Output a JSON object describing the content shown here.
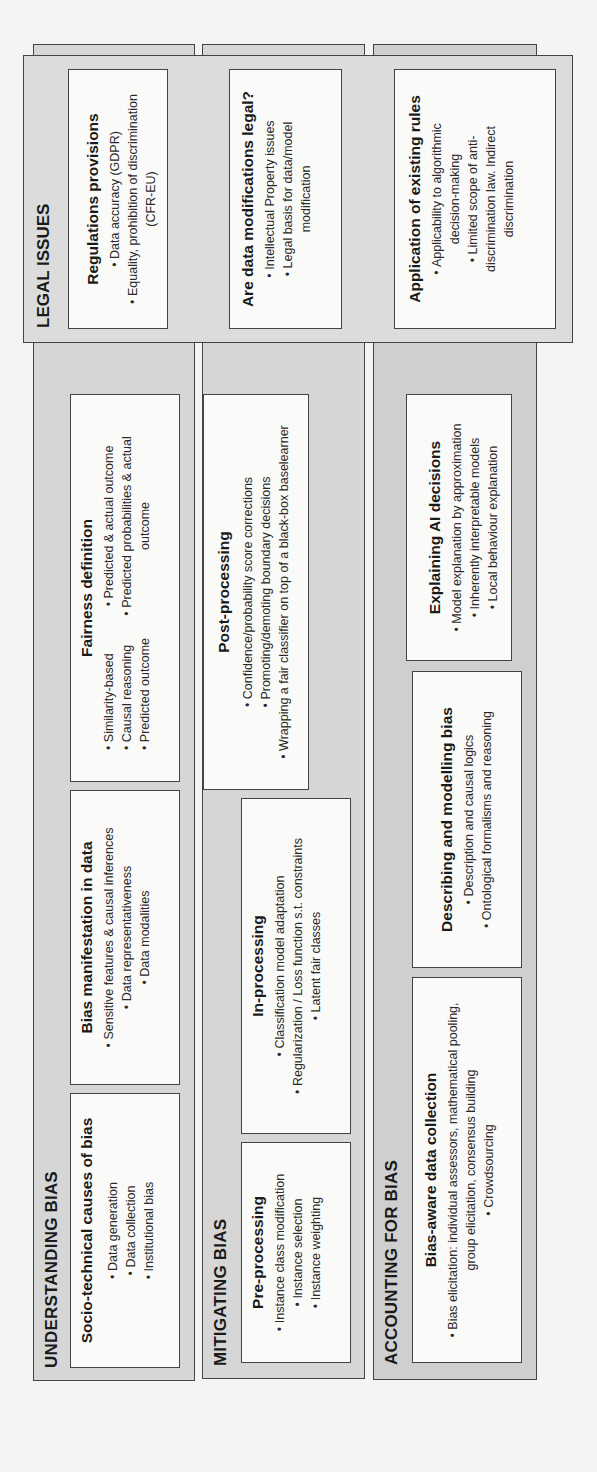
{
  "legal": {
    "title": "LEGAL ISSUES",
    "boxes": [
      {
        "title": "Regulations provisions",
        "items": [
          "Data accuracy (GDPR)",
          "Equality, prohibition of discrimination (CFR-EU)"
        ]
      },
      {
        "title": "Are data modifications legal?",
        "items": [
          "Intellectual Property issues",
          "Legal basis for data/model modification"
        ]
      },
      {
        "title": "Application of existing rules",
        "items": [
          "Applicability to algorithmic decision-making",
          "Limited scope of anti-discrimination law. Indirect discrimination"
        ]
      }
    ]
  },
  "understanding": {
    "title": "UNDERSTANDING BIAS",
    "boxes": [
      {
        "title": "Socio-technical causes of bias",
        "items": [
          "Data generation",
          "Data collection",
          "Institutional bias"
        ]
      },
      {
        "title": "Bias manifestation in data",
        "items": [
          "Sensitive features & causal inferences",
          "Data representativeness",
          "Data modalities"
        ]
      },
      {
        "title": "Fairness definition",
        "items_left": [
          "Similarity-based",
          "Causal reasoning",
          "Predicted outcome"
        ],
        "items_right": [
          "Predicted & actual outcome",
          "Predicted probabilities & actual outcome"
        ]
      }
    ]
  },
  "mitigating": {
    "title": "MITIGATING BIAS",
    "boxes": [
      {
        "title": "Pre-processing",
        "items": [
          "Instance class modification",
          "Instance selection",
          "Instance weighting"
        ]
      },
      {
        "title": "In-processing",
        "items": [
          "Classification model adaptation",
          "Regularization / Loss function s.t. constraints",
          "Latent fair classes"
        ]
      },
      {
        "title": "Post-processing",
        "items": [
          "Confidence/probability score corrections",
          "Promoting/demoting boundary decisions",
          "Wrapping a fair classifier on top of a black-box baselearner"
        ]
      }
    ]
  },
  "accounting": {
    "title": "ACCOUNTING FOR BIAS",
    "boxes": [
      {
        "title": "Bias-aware data collection",
        "items": [
          "Bias elicitation: individual assessors, mathematical pooling, group elicitation, consensus building",
          "Crowdsourcing"
        ]
      },
      {
        "title": "Describing and modelling bias",
        "items": [
          "Description and causal logics",
          "Ontological formalisms and reasoning"
        ]
      },
      {
        "title": "Explaining AI decisions",
        "items": [
          "Model explanation by approximation",
          "Inherently interpretable models",
          "Local behaviour explanation"
        ]
      }
    ]
  },
  "colors": {
    "background": "#f4f4f2",
    "panel": "#d6d6d6",
    "box": "#fafaf8",
    "border": "#444444",
    "text": "#1a1a1a"
  }
}
